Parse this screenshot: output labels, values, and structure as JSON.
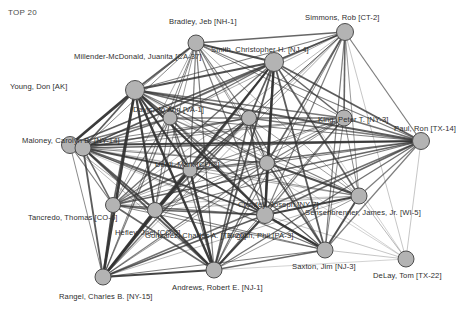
{
  "title": "TOP 20",
  "colors": {
    "background": "#ffffff",
    "node_fill": "#b3b3b3",
    "node_stroke": "#4d4d4d",
    "edge": "#333333",
    "label_text": "#2e2e2e",
    "title_text": "#4a4a4a"
  },
  "chart_data": {
    "type": "network",
    "title": "TOP 20",
    "node_count": 20,
    "nodes": [
      {
        "id": 0,
        "label": "Young, Don [AK]",
        "x": 70,
        "y": 145,
        "r": 8.5,
        "label_x": 10,
        "label_y": 82,
        "label_anchor": "start"
      },
      {
        "id": 1,
        "label": "Millender-McDonald, Juanita [CA-37]",
        "x": 135,
        "y": 90,
        "r": 9.5,
        "label_x": 74,
        "label_y": 52,
        "label_anchor": "start"
      },
      {
        "id": 2,
        "label": "Bradley, Jeb [NH-1]",
        "x": 196,
        "y": 43,
        "r": 8.0,
        "label_x": 169,
        "label_y": 17,
        "label_anchor": "middle"
      },
      {
        "id": 3,
        "label": "Smith, Christopher H. [NJ-4]",
        "x": 274,
        "y": 62,
        "r": 9.5,
        "label_x": 211,
        "label_y": 45,
        "label_anchor": "start"
      },
      {
        "id": 4,
        "label": "Simmons, Rob [CT-2]",
        "x": 345,
        "y": 32,
        "r": 8.5,
        "label_x": 305,
        "label_y": 13,
        "label_anchor": "start"
      },
      {
        "id": 5,
        "label": "Paul, Ron [TX-14]",
        "x": 421,
        "y": 141,
        "r": 8.5,
        "label_x": 394,
        "label_y": 124,
        "label_anchor": "start"
      },
      {
        "id": 6,
        "label": "Sensenbrenner, James, Jr. [WI-5]",
        "x": 359,
        "y": 196,
        "r": 8.0,
        "label_x": 305,
        "label_y": 208,
        "label_anchor": "start"
      },
      {
        "id": 7,
        "label": "DeLay, Tom [TX-22]",
        "x": 406,
        "y": 259,
        "r": 8.0,
        "label_x": 373,
        "label_y": 271,
        "label_anchor": "start"
      },
      {
        "id": 8,
        "label": "Saxton, Jim [NJ-3]",
        "x": 325,
        "y": 250,
        "r": 8.0,
        "label_x": 292,
        "label_y": 262,
        "label_anchor": "start"
      },
      {
        "id": 9,
        "label": "Andrews, Robert E. [NJ-1]",
        "x": 214,
        "y": 270,
        "r": 8.0,
        "label_x": 172,
        "label_y": 283,
        "label_anchor": "start"
      },
      {
        "id": 10,
        "label": "Rangel, Charles B. [NY-15]",
        "x": 103,
        "y": 277,
        "r": 8.0,
        "label_x": 59,
        "label_y": 292,
        "label_anchor": "start"
      },
      {
        "id": 11,
        "label": "Tancredo, Thomas [CO-6]",
        "x": 113,
        "y": 205,
        "r": 7.5,
        "label_x": 28,
        "label_y": 213,
        "label_anchor": "start"
      },
      {
        "id": 12,
        "label": "Maloney, Carolyn B. [NY-14]",
        "x": 83,
        "y": 148,
        "r": 8.0,
        "label_x": 22,
        "label_y": 136,
        "label_anchor": "start"
      },
      {
        "id": 13,
        "label": "Davis, Jo Ann [VA-1]",
        "x": 170,
        "y": 118,
        "r": 7.0,
        "label_x": 133,
        "label_y": 105,
        "label_anchor": "start"
      },
      {
        "id": 14,
        "label": "Udall, Mark [CO-2]",
        "x": 249,
        "y": 118,
        "r": 7.5,
        "label_x": 155,
        "label_y": 160,
        "label_anchor": "start"
      },
      {
        "id": 15,
        "label": "Hefley, Joel [CO-5]",
        "x": 190,
        "y": 170,
        "r": 7.0,
        "label_x": 115,
        "label_y": 228,
        "label_anchor": "start"
      },
      {
        "id": 16,
        "label": "Gonzalez, Charles A. [TX-20]",
        "x": 155,
        "y": 210,
        "r": 7.5,
        "label_x": 145,
        "label_y": 231,
        "label_anchor": "start"
      },
      {
        "id": 17,
        "label": "English, Phil [PA-3]",
        "x": 265,
        "y": 215,
        "r": 8.5,
        "label_x": 227,
        "label_y": 231,
        "label_anchor": "start"
      },
      {
        "id": 18,
        "label": "Crowley, Joseph [NY-7]",
        "x": 267,
        "y": 163,
        "r": 7.5,
        "label_x": 238,
        "label_y": 200,
        "label_anchor": "start"
      },
      {
        "id": 19,
        "label": "King, Peter T. [NY-3]",
        "x": 344,
        "y": 118,
        "r": 8.0,
        "label_x": 318,
        "label_y": 115,
        "label_anchor": "start"
      }
    ],
    "edges": [
      {
        "s": 0,
        "t": 1,
        "w": 2.6
      },
      {
        "s": 0,
        "t": 2,
        "w": 1.0
      },
      {
        "s": 0,
        "t": 3,
        "w": 1.5
      },
      {
        "s": 0,
        "t": 4,
        "w": 0.7
      },
      {
        "s": 0,
        "t": 5,
        "w": 2.2
      },
      {
        "s": 0,
        "t": 6,
        "w": 0.5
      },
      {
        "s": 0,
        "t": 8,
        "w": 0.5
      },
      {
        "s": 0,
        "t": 9,
        "w": 0.7
      },
      {
        "s": 0,
        "t": 10,
        "w": 1.0
      },
      {
        "s": 0,
        "t": 11,
        "w": 1.2
      },
      {
        "s": 0,
        "t": 12,
        "w": 1.6
      },
      {
        "s": 0,
        "t": 13,
        "w": 1.3
      },
      {
        "s": 0,
        "t": 14,
        "w": 1.0
      },
      {
        "s": 0,
        "t": 15,
        "w": 1.0
      },
      {
        "s": 0,
        "t": 16,
        "w": 0.8
      },
      {
        "s": 0,
        "t": 17,
        "w": 1.2
      },
      {
        "s": 0,
        "t": 18,
        "w": 0.7
      },
      {
        "s": 0,
        "t": 19,
        "w": 1.0
      },
      {
        "s": 1,
        "t": 2,
        "w": 1.8
      },
      {
        "s": 1,
        "t": 3,
        "w": 2.0
      },
      {
        "s": 1,
        "t": 4,
        "w": 1.2
      },
      {
        "s": 1,
        "t": 5,
        "w": 1.8
      },
      {
        "s": 1,
        "t": 6,
        "w": 1.2
      },
      {
        "s": 1,
        "t": 7,
        "w": 0.5
      },
      {
        "s": 1,
        "t": 8,
        "w": 1.2
      },
      {
        "s": 1,
        "t": 9,
        "w": 2.4
      },
      {
        "s": 1,
        "t": 10,
        "w": 2.6
      },
      {
        "s": 1,
        "t": 11,
        "w": 1.6
      },
      {
        "s": 1,
        "t": 12,
        "w": 1.8
      },
      {
        "s": 1,
        "t": 13,
        "w": 1.4
      },
      {
        "s": 1,
        "t": 14,
        "w": 1.5
      },
      {
        "s": 1,
        "t": 15,
        "w": 2.2
      },
      {
        "s": 1,
        "t": 16,
        "w": 2.2
      },
      {
        "s": 1,
        "t": 17,
        "w": 2.4
      },
      {
        "s": 1,
        "t": 18,
        "w": 1.4
      },
      {
        "s": 1,
        "t": 19,
        "w": 1.3
      },
      {
        "s": 2,
        "t": 3,
        "w": 2.0
      },
      {
        "s": 2,
        "t": 4,
        "w": 1.6
      },
      {
        "s": 2,
        "t": 5,
        "w": 1.2
      },
      {
        "s": 2,
        "t": 6,
        "w": 0.8
      },
      {
        "s": 2,
        "t": 8,
        "w": 0.8
      },
      {
        "s": 2,
        "t": 9,
        "w": 1.2
      },
      {
        "s": 2,
        "t": 10,
        "w": 1.0
      },
      {
        "s": 2,
        "t": 11,
        "w": 0.8
      },
      {
        "s": 2,
        "t": 12,
        "w": 1.0
      },
      {
        "s": 2,
        "t": 13,
        "w": 1.0
      },
      {
        "s": 2,
        "t": 14,
        "w": 1.2
      },
      {
        "s": 2,
        "t": 15,
        "w": 1.2
      },
      {
        "s": 2,
        "t": 16,
        "w": 0.9
      },
      {
        "s": 2,
        "t": 17,
        "w": 1.2
      },
      {
        "s": 2,
        "t": 18,
        "w": 0.9
      },
      {
        "s": 2,
        "t": 19,
        "w": 1.0
      },
      {
        "s": 3,
        "t": 4,
        "w": 1.8
      },
      {
        "s": 3,
        "t": 5,
        "w": 1.8
      },
      {
        "s": 3,
        "t": 6,
        "w": 1.6
      },
      {
        "s": 3,
        "t": 7,
        "w": 0.5
      },
      {
        "s": 3,
        "t": 8,
        "w": 1.8
      },
      {
        "s": 3,
        "t": 9,
        "w": 1.8
      },
      {
        "s": 3,
        "t": 10,
        "w": 1.6
      },
      {
        "s": 3,
        "t": 11,
        "w": 1.4
      },
      {
        "s": 3,
        "t": 12,
        "w": 1.6
      },
      {
        "s": 3,
        "t": 13,
        "w": 1.4
      },
      {
        "s": 3,
        "t": 14,
        "w": 1.8
      },
      {
        "s": 3,
        "t": 15,
        "w": 1.8
      },
      {
        "s": 3,
        "t": 16,
        "w": 1.6
      },
      {
        "s": 3,
        "t": 17,
        "w": 2.4
      },
      {
        "s": 3,
        "t": 18,
        "w": 1.8
      },
      {
        "s": 3,
        "t": 19,
        "w": 1.6
      },
      {
        "s": 4,
        "t": 5,
        "w": 1.2
      },
      {
        "s": 4,
        "t": 6,
        "w": 0.9
      },
      {
        "s": 4,
        "t": 7,
        "w": 0.6
      },
      {
        "s": 4,
        "t": 8,
        "w": 1.2
      },
      {
        "s": 4,
        "t": 9,
        "w": 1.0
      },
      {
        "s": 4,
        "t": 10,
        "w": 0.8
      },
      {
        "s": 4,
        "t": 11,
        "w": 0.7
      },
      {
        "s": 4,
        "t": 12,
        "w": 0.8
      },
      {
        "s": 4,
        "t": 13,
        "w": 0.8
      },
      {
        "s": 4,
        "t": 14,
        "w": 1.0
      },
      {
        "s": 4,
        "t": 15,
        "w": 0.9
      },
      {
        "s": 4,
        "t": 16,
        "w": 0.7
      },
      {
        "s": 4,
        "t": 17,
        "w": 1.2
      },
      {
        "s": 4,
        "t": 18,
        "w": 1.6
      },
      {
        "s": 4,
        "t": 19,
        "w": 1.6
      },
      {
        "s": 5,
        "t": 6,
        "w": 1.2
      },
      {
        "s": 5,
        "t": 7,
        "w": 0.6
      },
      {
        "s": 5,
        "t": 8,
        "w": 1.2
      },
      {
        "s": 5,
        "t": 9,
        "w": 1.4
      },
      {
        "s": 5,
        "t": 10,
        "w": 1.4
      },
      {
        "s": 5,
        "t": 11,
        "w": 1.6
      },
      {
        "s": 5,
        "t": 12,
        "w": 1.6
      },
      {
        "s": 5,
        "t": 13,
        "w": 1.2
      },
      {
        "s": 5,
        "t": 14,
        "w": 1.3
      },
      {
        "s": 5,
        "t": 15,
        "w": 1.4
      },
      {
        "s": 5,
        "t": 16,
        "w": 1.2
      },
      {
        "s": 5,
        "t": 17,
        "w": 1.6
      },
      {
        "s": 5,
        "t": 18,
        "w": 1.2
      },
      {
        "s": 5,
        "t": 19,
        "w": 1.4
      },
      {
        "s": 6,
        "t": 7,
        "w": 0.7
      },
      {
        "s": 6,
        "t": 8,
        "w": 2.0
      },
      {
        "s": 6,
        "t": 9,
        "w": 0.9
      },
      {
        "s": 6,
        "t": 10,
        "w": 0.7
      },
      {
        "s": 6,
        "t": 11,
        "w": 0.6
      },
      {
        "s": 6,
        "t": 12,
        "w": 0.7
      },
      {
        "s": 6,
        "t": 13,
        "w": 0.7
      },
      {
        "s": 6,
        "t": 14,
        "w": 0.9
      },
      {
        "s": 6,
        "t": 15,
        "w": 0.8
      },
      {
        "s": 6,
        "t": 16,
        "w": 0.7
      },
      {
        "s": 6,
        "t": 17,
        "w": 2.2
      },
      {
        "s": 6,
        "t": 18,
        "w": 2.0
      },
      {
        "s": 6,
        "t": 19,
        "w": 1.0
      },
      {
        "s": 7,
        "t": 8,
        "w": 0.6
      },
      {
        "s": 7,
        "t": 9,
        "w": 0.5
      },
      {
        "s": 7,
        "t": 17,
        "w": 0.6
      },
      {
        "s": 7,
        "t": 18,
        "w": 0.5
      },
      {
        "s": 8,
        "t": 9,
        "w": 1.6
      },
      {
        "s": 8,
        "t": 10,
        "w": 1.2
      },
      {
        "s": 8,
        "t": 11,
        "w": 1.0
      },
      {
        "s": 8,
        "t": 12,
        "w": 1.2
      },
      {
        "s": 8,
        "t": 13,
        "w": 0.9
      },
      {
        "s": 8,
        "t": 14,
        "w": 1.2
      },
      {
        "s": 8,
        "t": 15,
        "w": 1.4
      },
      {
        "s": 8,
        "t": 16,
        "w": 1.2
      },
      {
        "s": 8,
        "t": 17,
        "w": 2.6
      },
      {
        "s": 8,
        "t": 18,
        "w": 1.8
      },
      {
        "s": 8,
        "t": 19,
        "w": 1.0
      },
      {
        "s": 9,
        "t": 10,
        "w": 2.2
      },
      {
        "s": 9,
        "t": 11,
        "w": 1.6
      },
      {
        "s": 9,
        "t": 12,
        "w": 1.8
      },
      {
        "s": 9,
        "t": 13,
        "w": 1.2
      },
      {
        "s": 9,
        "t": 14,
        "w": 1.6
      },
      {
        "s": 9,
        "t": 15,
        "w": 2.4
      },
      {
        "s": 9,
        "t": 16,
        "w": 2.2
      },
      {
        "s": 9,
        "t": 17,
        "w": 2.2
      },
      {
        "s": 9,
        "t": 18,
        "w": 1.4
      },
      {
        "s": 9,
        "t": 19,
        "w": 1.0
      },
      {
        "s": 10,
        "t": 11,
        "w": 2.0
      },
      {
        "s": 10,
        "t": 12,
        "w": 1.8
      },
      {
        "s": 10,
        "t": 13,
        "w": 1.2
      },
      {
        "s": 10,
        "t": 14,
        "w": 1.4
      },
      {
        "s": 10,
        "t": 15,
        "w": 2.2
      },
      {
        "s": 10,
        "t": 16,
        "w": 2.4
      },
      {
        "s": 10,
        "t": 17,
        "w": 1.8
      },
      {
        "s": 10,
        "t": 18,
        "w": 1.2
      },
      {
        "s": 10,
        "t": 19,
        "w": 0.9
      },
      {
        "s": 11,
        "t": 12,
        "w": 1.6
      },
      {
        "s": 11,
        "t": 13,
        "w": 1.2
      },
      {
        "s": 11,
        "t": 14,
        "w": 1.2
      },
      {
        "s": 11,
        "t": 15,
        "w": 1.6
      },
      {
        "s": 11,
        "t": 16,
        "w": 1.6
      },
      {
        "s": 11,
        "t": 17,
        "w": 1.4
      },
      {
        "s": 11,
        "t": 18,
        "w": 1.0
      },
      {
        "s": 11,
        "t": 19,
        "w": 0.8
      },
      {
        "s": 12,
        "t": 13,
        "w": 1.4
      },
      {
        "s": 12,
        "t": 14,
        "w": 1.4
      },
      {
        "s": 12,
        "t": 15,
        "w": 1.8
      },
      {
        "s": 12,
        "t": 16,
        "w": 1.8
      },
      {
        "s": 12,
        "t": 17,
        "w": 1.6
      },
      {
        "s": 12,
        "t": 18,
        "w": 1.1
      },
      {
        "s": 12,
        "t": 19,
        "w": 0.9
      },
      {
        "s": 13,
        "t": 14,
        "w": 1.2
      },
      {
        "s": 13,
        "t": 15,
        "w": 1.4
      },
      {
        "s": 13,
        "t": 16,
        "w": 1.2
      },
      {
        "s": 13,
        "t": 17,
        "w": 1.2
      },
      {
        "s": 13,
        "t": 18,
        "w": 1.0
      },
      {
        "s": 13,
        "t": 19,
        "w": 0.9
      },
      {
        "s": 14,
        "t": 15,
        "w": 1.6
      },
      {
        "s": 14,
        "t": 16,
        "w": 1.4
      },
      {
        "s": 14,
        "t": 17,
        "w": 1.6
      },
      {
        "s": 14,
        "t": 18,
        "w": 1.4
      },
      {
        "s": 14,
        "t": 19,
        "w": 1.2
      },
      {
        "s": 15,
        "t": 16,
        "w": 1.8
      },
      {
        "s": 15,
        "t": 17,
        "w": 1.8
      },
      {
        "s": 15,
        "t": 18,
        "w": 1.2
      },
      {
        "s": 15,
        "t": 19,
        "w": 1.0
      },
      {
        "s": 16,
        "t": 17,
        "w": 1.6
      },
      {
        "s": 16,
        "t": 18,
        "w": 1.1
      },
      {
        "s": 16,
        "t": 19,
        "w": 0.9
      },
      {
        "s": 17,
        "t": 18,
        "w": 1.8
      },
      {
        "s": 17,
        "t": 19,
        "w": 1.2
      },
      {
        "s": 18,
        "t": 19,
        "w": 1.2
      }
    ]
  }
}
